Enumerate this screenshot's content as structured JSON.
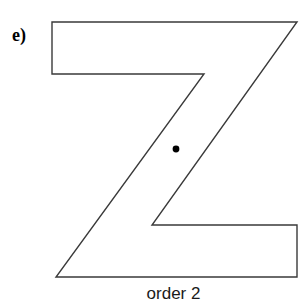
{
  "figure": {
    "part_label": "e)",
    "caption": "order 2",
    "shape_name": "z-polygon",
    "stroke_color": "#3a3a3a",
    "fill_color": "#ffffff",
    "center_dot_color": "#000000",
    "canvas": {
      "width": 307,
      "height": 306
    },
    "polygon_points": "52,22 297,22 152,225 297,225 297,277 56,277 204,74 52,74",
    "vertices": [
      {
        "name": "top-left",
        "x": 52,
        "y": 22
      },
      {
        "name": "top-right",
        "x": 297,
        "y": 22
      },
      {
        "name": "mid-lower-left-notch",
        "x": 152,
        "y": 225
      },
      {
        "name": "lower-bar-right-top",
        "x": 297,
        "y": 225
      },
      {
        "name": "bottom-right",
        "x": 297,
        "y": 277
      },
      {
        "name": "bottom-left",
        "x": 56,
        "y": 277
      },
      {
        "name": "mid-upper-right-notch",
        "x": 204,
        "y": 74
      },
      {
        "name": "upper-bar-left-bottom",
        "x": 52,
        "y": 74
      }
    ],
    "center_dot": {
      "cx": 176,
      "cy": 149,
      "r": 3.4
    },
    "rotational_symmetry_order": 2
  }
}
